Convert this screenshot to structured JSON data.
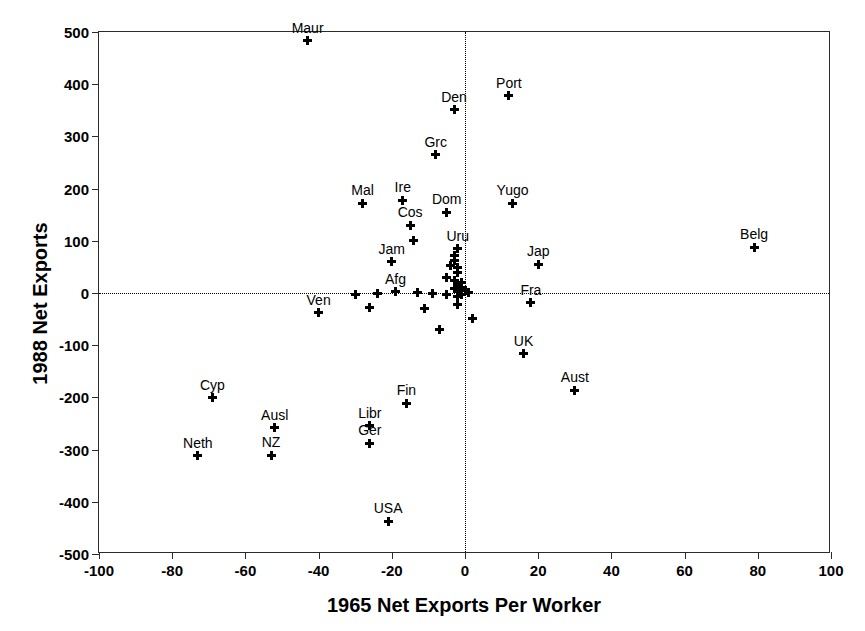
{
  "chart_data": {
    "type": "scatter",
    "title": "",
    "xlabel": "1965 Net Exports Per Worker",
    "ylabel": "1988 Net Exports",
    "xlim": [
      -100,
      100
    ],
    "ylim": [
      -500,
      500
    ],
    "xticks": [
      -100,
      -80,
      -60,
      -40,
      -20,
      0,
      20,
      40,
      60,
      80,
      100
    ],
    "yticks": [
      -500,
      -400,
      -300,
      -200,
      -100,
      0,
      100,
      200,
      300,
      400,
      500
    ],
    "xtick_labels": [
      "-100",
      "-80",
      "-60",
      "-40",
      "-20",
      "0",
      "20",
      "40",
      "60",
      "80",
      "100"
    ],
    "ytick_labels": [
      "-500",
      "-400",
      "-300",
      "-200",
      "-100",
      "0",
      "100",
      "200",
      "300",
      "400",
      "500"
    ],
    "grid": false,
    "legend": "none",
    "reference_lines": [
      {
        "axis": "y",
        "value": 0,
        "style": "dotted"
      },
      {
        "axis": "x",
        "value": 0,
        "style": "dotted"
      }
    ],
    "marker_style": "plus",
    "marker_color": "#000000",
    "points": [
      {
        "label": "Maur",
        "x": -43,
        "y": 483,
        "label_pos": "above"
      },
      {
        "label": "Port",
        "x": 12,
        "y": 378,
        "label_pos": "above"
      },
      {
        "label": "Den",
        "x": -3,
        "y": 351,
        "label_pos": "above"
      },
      {
        "label": "Grc",
        "x": -8,
        "y": 265,
        "label_pos": "above"
      },
      {
        "label": "Ire",
        "x": -17,
        "y": 178,
        "label_pos": "above"
      },
      {
        "label": "Mal",
        "x": -28,
        "y": 172,
        "label_pos": "above"
      },
      {
        "label": "Yugo",
        "x": 13,
        "y": 172,
        "label_pos": "above"
      },
      {
        "label": "Dom",
        "x": -5,
        "y": 155,
        "label_pos": "above"
      },
      {
        "label": "Cos",
        "x": -15,
        "y": 130,
        "label_pos": "above"
      },
      {
        "label": "Belg",
        "x": 79,
        "y": 88,
        "label_pos": "above"
      },
      {
        "label": "Uru",
        "x": -2,
        "y": 85,
        "label_pos": "above"
      },
      {
        "label": "Jam",
        "x": -20,
        "y": 60,
        "label_pos": "above"
      },
      {
        "label": "Jap",
        "x": 20,
        "y": 55,
        "label_pos": "above"
      },
      {
        "label": "Afg",
        "x": -19,
        "y": 2,
        "label_pos": "above"
      },
      {
        "label": "Fra",
        "x": 18,
        "y": -19,
        "label_pos": "above"
      },
      {
        "label": "Ven",
        "x": -40,
        "y": -38,
        "label_pos": "above"
      },
      {
        "label": "UK",
        "x": 16,
        "y": -116,
        "label_pos": "above"
      },
      {
        "label": "Aust",
        "x": 30,
        "y": -186,
        "label_pos": "above"
      },
      {
        "label": "Cyp",
        "x": -69,
        "y": -201,
        "label_pos": "above"
      },
      {
        "label": "Fin",
        "x": -16,
        "y": -211,
        "label_pos": "above"
      },
      {
        "label": "Libr",
        "x": -26,
        "y": -254,
        "label_pos": "above"
      },
      {
        "label": "Ausl",
        "x": -52,
        "y": -258,
        "label_pos": "above"
      },
      {
        "label": "Ger",
        "x": -26,
        "y": -288,
        "label_pos": "above"
      },
      {
        "label": "NZ",
        "x": -53,
        "y": -311,
        "label_pos": "above"
      },
      {
        "label": "Neth",
        "x": -73,
        "y": -312,
        "label_pos": "above"
      },
      {
        "label": "USA",
        "x": -21,
        "y": -437,
        "label_pos": "above"
      },
      {
        "label": "",
        "x": -14,
        "y": 100
      },
      {
        "label": "",
        "x": -3,
        "y": 72
      },
      {
        "label": "",
        "x": -3,
        "y": 62
      },
      {
        "label": "",
        "x": -4,
        "y": 52
      },
      {
        "label": "",
        "x": -2,
        "y": 48
      },
      {
        "label": "",
        "x": -2,
        "y": 40
      },
      {
        "label": "",
        "x": -5,
        "y": 30
      },
      {
        "label": "",
        "x": -3,
        "y": 24
      },
      {
        "label": "",
        "x": -1,
        "y": 20
      },
      {
        "label": "",
        "x": -2,
        "y": 14
      },
      {
        "label": "",
        "x": -1,
        "y": 10
      },
      {
        "label": "",
        "x": -3,
        "y": 8
      },
      {
        "label": "",
        "x": -1,
        "y": 5
      },
      {
        "label": "",
        "x": -2,
        "y": 2
      },
      {
        "label": "",
        "x": 0,
        "y": 4
      },
      {
        "label": "",
        "x": 1,
        "y": 1
      },
      {
        "label": "",
        "x": -1,
        "y": -3
      },
      {
        "label": "",
        "x": -2,
        "y": -6
      },
      {
        "label": "",
        "x": -5,
        "y": -2
      },
      {
        "label": "",
        "x": -9,
        "y": 0
      },
      {
        "label": "",
        "x": -13,
        "y": 1
      },
      {
        "label": "",
        "x": -24,
        "y": 0
      },
      {
        "label": "",
        "x": -30,
        "y": -3
      },
      {
        "label": "",
        "x": -26,
        "y": -28
      },
      {
        "label": "",
        "x": -11,
        "y": -30
      },
      {
        "label": "",
        "x": -7,
        "y": -70
      },
      {
        "label": "",
        "x": 2,
        "y": -49
      },
      {
        "label": "",
        "x": -2,
        "y": -22
      }
    ]
  }
}
